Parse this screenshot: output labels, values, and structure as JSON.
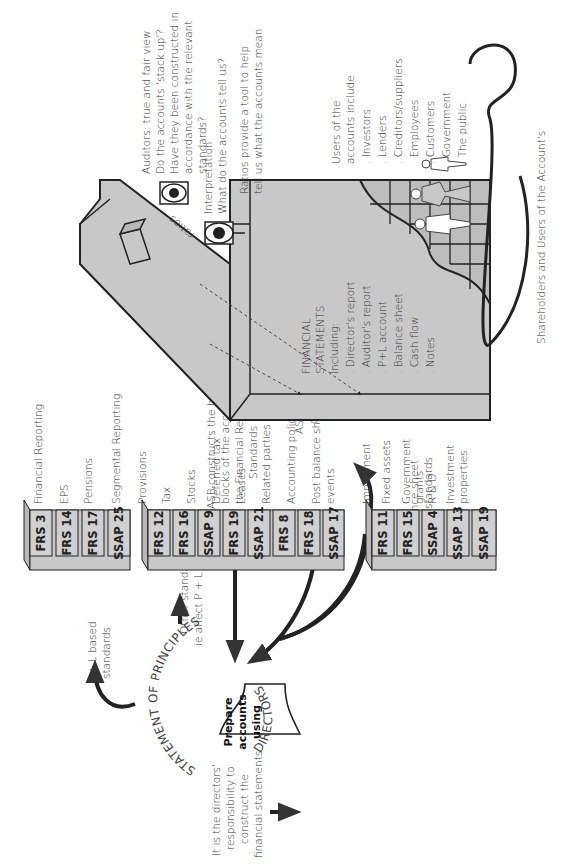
{
  "directors": {
    "arc_label": "DIRECTORS",
    "funnel_label": [
      "Prepare",
      "accounts",
      "using"
    ],
    "responsibility_note": [
      "It is the directors'",
      "responsibility to",
      "construct the",
      "financial statements"
    ]
  },
  "statement_of_principles": {
    "arc_label": "STATEMENT OF PRINCIPLES"
  },
  "asb": {
    "constructs_note": [
      "ASB constructs the building",
      "blocks of the accounts:",
      "the Financial Reporting",
      "Standards"
    ],
    "quality_note": [
      "ASB as quality",
      "control"
    ]
  },
  "stacks": [
    {
      "caption": [
        "P + L based",
        "standards"
      ],
      "books": [
        {
          "spine": "FRS 3",
          "topic": [
            "Financial Reporting"
          ]
        },
        {
          "spine": "FRS 14",
          "topic": [
            "EPS"
          ]
        },
        {
          "spine": "FRS 17",
          "topic": [
            "Pensions"
          ]
        },
        {
          "spine": "SSAP 25",
          "topic": [
            "Segmental Reporting"
          ]
        }
      ]
    },
    {
      "caption": [
        "Other standards",
        "ie affect P + L and",
        "B/S or notes to",
        "the accounts"
      ],
      "books": [
        {
          "spine": "FRS 12",
          "topic": [
            "Provisions"
          ]
        },
        {
          "spine": "FRS 16",
          "topic": [
            "Tax"
          ]
        },
        {
          "spine": "SSAP 9",
          "topic": [
            "Stocks"
          ]
        },
        {
          "spine": "FRS 19",
          "topic": [
            "Deferred tax"
          ]
        },
        {
          "spine": "SSAP 21",
          "topic": [
            "Leases"
          ]
        },
        {
          "spine": "FRS 8",
          "topic": [
            "Related parties"
          ]
        },
        {
          "spine": "FRS 18",
          "topic": [
            "Accounting policies"
          ]
        },
        {
          "spine": "SSAP 17",
          "topic": [
            "Post balance sheet",
            "events"
          ]
        }
      ]
    },
    {
      "caption": [
        "Balance sheet",
        "based standards"
      ],
      "books": [
        {
          "spine": "FRS 11",
          "topic": [
            "Impairment"
          ]
        },
        {
          "spine": "FRS 15",
          "topic": [
            "Fixed assets"
          ]
        },
        {
          "spine": "SSAP 4",
          "topic": [
            "Government",
            "grants"
          ]
        },
        {
          "spine": "SSAP 13",
          "topic": [
            "R & D"
          ]
        },
        {
          "spine": "SSAP 19",
          "topic": [
            "Investment",
            "properties"
          ]
        }
      ]
    }
  ],
  "building": {
    "heading": [
      "FINANCIAL",
      "STATEMENTS",
      "Including:"
    ],
    "items": [
      ". Director's report",
      ". Auditor's report",
      ". P+L account",
      ". Balance sheet",
      ". Cash flow",
      ". Notes"
    ]
  },
  "eyes": {
    "ratios_label": "ratios",
    "auditors_note": [
      "Auditors: true and fair view",
      "Do the accounts 'stack up'?",
      "Have they been constructed in",
      "accordance with the relevant",
      "standards?"
    ],
    "interpretation_note": [
      "Interpretation",
      "What do the accounts tell us?"
    ],
    "ratios_note": [
      "Ratios provide a tool to help",
      "tell us what the accounts mean"
    ]
  },
  "users": {
    "heading": [
      "Users of the",
      "accounts include"
    ],
    "items": [
      ". Investors",
      ". Lenders",
      ". Creditors/suppliers",
      ". Employees",
      ". Customers",
      ". Government",
      ". The public"
    ],
    "arrow_label": "Shareholders and Users of the Account's"
  },
  "colors": {
    "fill": "#c8c8c8",
    "stroke": "#2a2a2a",
    "text": "#333333"
  }
}
